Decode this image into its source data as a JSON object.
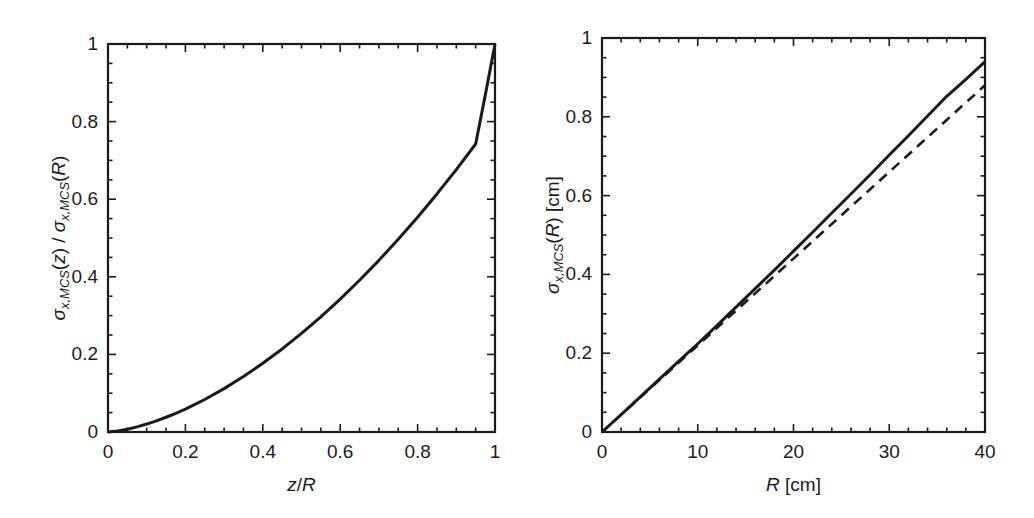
{
  "figure": {
    "background_color": "#ffffff",
    "line_color": "#1a1a1a",
    "panel_count": 2
  },
  "chart_data": [
    {
      "type": "line",
      "panel": "left",
      "title": "",
      "xlabel": "z/R",
      "ylabel": "σx,MCS(z) / σx,MCS(R)",
      "xlim": [
        0,
        1
      ],
      "ylim": [
        0,
        1
      ],
      "xticks": [
        0,
        0.2,
        0.4,
        0.6,
        0.8,
        1
      ],
      "yticks": [
        0,
        0.2,
        0.4,
        0.6,
        0.8,
        1
      ],
      "xtick_labels": [
        "0",
        "0.2",
        "0.4",
        "0.6",
        "0.8",
        "1"
      ],
      "ytick_labels": [
        "0",
        "0.2",
        "0.4",
        "0.6",
        "0.8",
        "1"
      ],
      "minor_ticks_per_major": 4,
      "tick_direction": "in",
      "grid": false,
      "legend": "none",
      "series": [
        {
          "name": "normalized MCS spread",
          "style": "solid",
          "color": "#1a1a1a",
          "x": [
            0,
            0.025,
            0.05,
            0.075,
            0.1,
            0.125,
            0.15,
            0.175,
            0.2,
            0.25,
            0.3,
            0.35,
            0.4,
            0.45,
            0.5,
            0.55,
            0.6,
            0.65,
            0.7,
            0.75,
            0.8,
            0.85,
            0.9,
            0.95,
            0.975,
            1
          ],
          "y": [
            0,
            0.0025,
            0.0072,
            0.0132,
            0.0205,
            0.0288,
            0.038,
            0.0482,
            0.0592,
            0.0838,
            0.1118,
            0.1429,
            0.177,
            0.2141,
            0.2541,
            0.2969,
            0.3426,
            0.3911,
            0.4424,
            0.4966,
            0.5536,
            0.6136,
            0.6764,
            0.7422,
            0.8689,
            1.0
          ]
        }
      ]
    },
    {
      "type": "line",
      "panel": "right",
      "title": "",
      "xlabel": "R [cm]",
      "ylabel": "σx,MCS(R) [cm]",
      "xlim": [
        0,
        40
      ],
      "ylim": [
        0,
        1
      ],
      "xticks": [
        0,
        10,
        20,
        30,
        40
      ],
      "yticks": [
        0,
        0.2,
        0.4,
        0.6,
        0.8,
        1
      ],
      "xtick_labels": [
        "0",
        "10",
        "20",
        "30",
        "40"
      ],
      "ytick_labels": [
        "0",
        "0.2",
        "0.4",
        "0.6",
        "0.8",
        "1"
      ],
      "minor_ticks_per_major": 5,
      "tick_direction": "in",
      "grid": false,
      "legend": "none",
      "series": [
        {
          "name": "exact MCS spread",
          "style": "solid",
          "color": "#1a1a1a",
          "x": [
            0,
            2,
            4,
            6,
            8,
            10,
            12,
            14,
            16,
            18,
            20,
            22,
            24,
            26,
            28,
            30,
            32,
            34,
            36,
            38,
            40
          ],
          "y": [
            0,
            0.044,
            0.089,
            0.134,
            0.179,
            0.224,
            0.27,
            0.317,
            0.364,
            0.411,
            0.459,
            0.507,
            0.556,
            0.604,
            0.653,
            0.703,
            0.752,
            0.802,
            0.852,
            0.895,
            0.94
          ]
        },
        {
          "name": "linear approximation",
          "style": "dashed",
          "color": "#1a1a1a",
          "x": [
            0,
            40
          ],
          "y": [
            0,
            0.88
          ]
        }
      ]
    }
  ],
  "left_panel": {
    "x_axis": {
      "title_html": "<span class=\"it\">z</span>/<span class=\"it\">R</span>",
      "tick_labels": [
        "0",
        "0.2",
        "0.4",
        "0.6",
        "0.8",
        "1"
      ]
    },
    "y_axis": {
      "title_html": "<span class=\"sigma\">σ</span><span class=\"sub\">x,MCS</span>(<span class=\"it\">z</span>) / <span class=\"sigma\">σ</span><span class=\"sub\">x,MCS</span>(<span class=\"it\">R</span>)",
      "tick_labels": [
        "0",
        "0.2",
        "0.4",
        "0.6",
        "0.8",
        "1"
      ]
    }
  },
  "right_panel": {
    "x_axis": {
      "title_html": "<span class=\"it\">R</span> [cm]",
      "tick_labels": [
        "0",
        "10",
        "20",
        "30",
        "40"
      ]
    },
    "y_axis": {
      "title_html": "<span class=\"sigma\">σ</span><span class=\"sub\">x,MCS</span>(<span class=\"it\">R</span>) [cm]",
      "tick_labels": [
        "0",
        "0.2",
        "0.4",
        "0.6",
        "0.8",
        "1"
      ]
    }
  }
}
